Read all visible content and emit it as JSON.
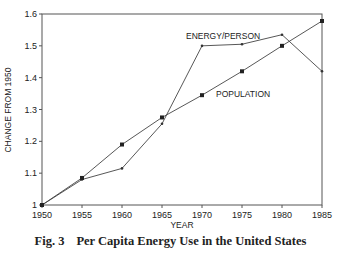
{
  "chart_data": {
    "type": "line",
    "title": "Per Capita Energy Use in the United States",
    "figure_number": "Fig. 3",
    "xlabel": "YEAR",
    "ylabel": "CHANGE FROM 1950",
    "x": [
      1950,
      1955,
      1960,
      1965,
      1970,
      1975,
      1980,
      1985
    ],
    "series": [
      {
        "name": "ENERGY/PERSON",
        "marker": "small-dot",
        "values": [
          1.0,
          1.08,
          1.115,
          1.255,
          1.5,
          1.505,
          1.535,
          1.42
        ]
      },
      {
        "name": "POPULATION",
        "marker": "square",
        "values": [
          1.0,
          1.085,
          1.19,
          1.275,
          1.345,
          1.42,
          1.5,
          1.578
        ]
      }
    ],
    "xticks": [
      "1950",
      "1955",
      "1960",
      "1965",
      "1970",
      "1975",
      "1980",
      "1985"
    ],
    "yticks": [
      "1",
      "1.1",
      "1.2",
      "1.3",
      "1.4",
      "1.5",
      "1.6"
    ],
    "xlim": [
      1950,
      1985
    ],
    "ylim": [
      1.0,
      1.6
    ],
    "grid": false,
    "legend": "inline labels"
  },
  "caption": {
    "number": "Fig. 3",
    "text": "Per Capita Energy Use in the United States"
  }
}
